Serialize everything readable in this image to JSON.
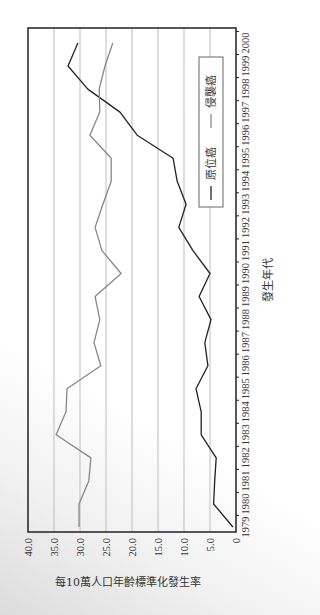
{
  "chart_data": {
    "type": "line",
    "orientation": "rotated 90° counter-clockwise (axes labels read bottom-to-top)",
    "title": "",
    "xlabel": "發生年代",
    "ylabel": "每10萬人口年齡標準化發生率",
    "ylim": [
      0,
      40
    ],
    "yticks": [
      "0",
      "5.0",
      "10.0",
      "15.0",
      "20.0",
      "25.0",
      "30.0",
      "35.0",
      "40.0"
    ],
    "grid": true,
    "legend_position": "upper right (inside plot)",
    "x": [
      1979,
      1980,
      1981,
      1982,
      1983,
      1984,
      1985,
      1986,
      1987,
      1988,
      1989,
      1990,
      1991,
      1992,
      1993,
      1994,
      1995,
      1996,
      1997,
      1998,
      1999,
      2000
    ],
    "series": [
      {
        "name": "原位癌",
        "color": "#222222",
        "values": [
          0.6,
          4.3,
          4.1,
          3.8,
          6.7,
          6.7,
          7.7,
          5.4,
          6.0,
          4.8,
          7.1,
          5.0,
          8.3,
          11.0,
          9.6,
          11.3,
          12.1,
          19.0,
          22.3,
          28.5,
          32.3,
          30.4
        ]
      },
      {
        "name": "侵襲癌",
        "color": "#888888",
        "values": [
          30.2,
          30.2,
          28.3,
          27.9,
          34.6,
          32.7,
          32.5,
          26.0,
          27.3,
          26.2,
          27.1,
          22.1,
          25.8,
          27.1,
          25.6,
          24.0,
          24.0,
          28.1,
          26.2,
          26.3,
          25.2,
          23.7
        ]
      }
    ]
  },
  "legend": {
    "items": [
      {
        "label": "原位癌",
        "color": "#222222"
      },
      {
        "label": "侵襲癌",
        "color": "#888888"
      }
    ]
  }
}
